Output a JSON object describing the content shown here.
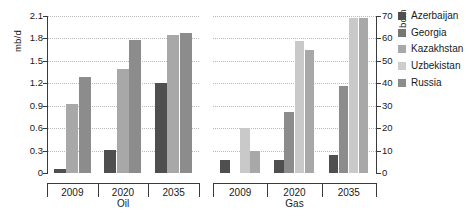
{
  "chart_data": [
    {
      "type": "bar",
      "id": "oil",
      "title": "",
      "xlabel": "Oil",
      "ylabel": "mb/d",
      "categories": [
        "2009",
        "2020",
        "2035"
      ],
      "ylim": [
        0,
        2.1
      ],
      "yticks": [
        "0",
        "0.3",
        "0.6",
        "0.9",
        "1.2",
        "1.5",
        "1.8",
        "2.1"
      ],
      "ytick_values": [
        0,
        0.3,
        0.6,
        0.9,
        1.2,
        1.5,
        1.8,
        2.1
      ],
      "grid": true,
      "axis_side": "left",
      "series": [
        {
          "name": "Azerbaijan",
          "color": "#4f4f4f",
          "values": [
            0.05,
            0.31,
            1.21
          ]
        },
        {
          "name": "Kazakhstan",
          "color": "#a8a8a8",
          "values": [
            0.92,
            1.39,
            1.85
          ]
        },
        {
          "name": "Russia",
          "color": "#8c8c8c",
          "values": [
            1.29,
            1.78,
            1.87
          ]
        }
      ]
    },
    {
      "type": "bar",
      "id": "gas",
      "title": "",
      "xlabel": "Gas",
      "ylabel": "bcm",
      "categories": [
        "2009",
        "2020",
        "2035"
      ],
      "ylim": [
        0,
        70
      ],
      "yticks": [
        "0",
        "10",
        "20",
        "30",
        "40",
        "50",
        "60",
        "70"
      ],
      "ytick_values": [
        0,
        10,
        20,
        30,
        40,
        50,
        60,
        70
      ],
      "grid": true,
      "axis_side": "right",
      "series": [
        {
          "name": "Azerbaijan",
          "color": "#4f4f4f",
          "values": [
            6,
            6,
            8
          ]
        },
        {
          "name": "Kazakhstan",
          "color": "#8c8c8c",
          "values": [
            0,
            27,
            39
          ]
        },
        {
          "name": "Uzbekistan",
          "color": "#c9c9c9",
          "values": [
            20,
            59,
            69
          ]
        },
        {
          "name": "Russia",
          "color": "#a8a8a8",
          "values": [
            10,
            55,
            69
          ]
        }
      ]
    }
  ],
  "legend": {
    "position": "right",
    "items": [
      {
        "label": "Azerbaijan",
        "color": "#4f4f4f"
      },
      {
        "label": "Georgia",
        "color": "#777777"
      },
      {
        "label": "Kazakhstan",
        "color": "#a8a8a8"
      },
      {
        "label": "Uzbekistan",
        "color": "#cdcdcd"
      },
      {
        "label": "Russia",
        "color": "#8c8c8c"
      }
    ]
  }
}
